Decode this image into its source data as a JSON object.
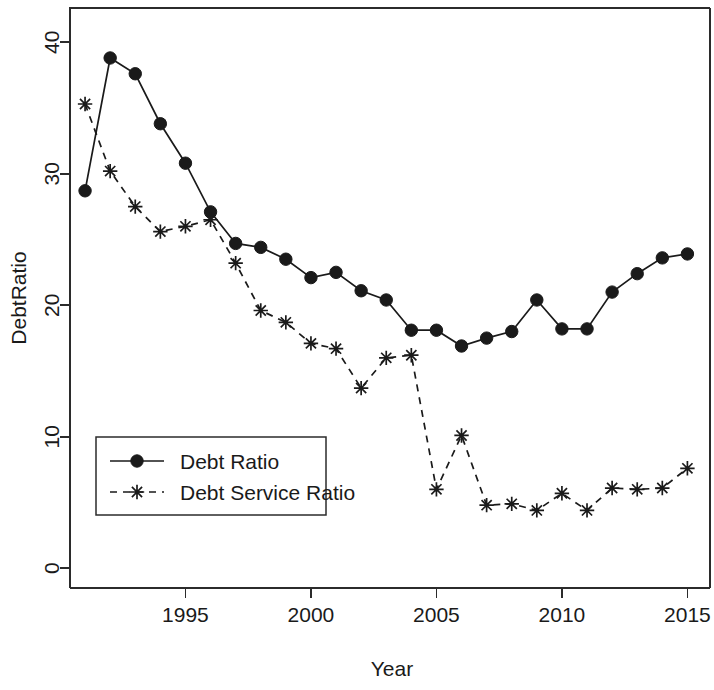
{
  "chart_data": {
    "type": "line",
    "title": "",
    "xlabel": "Year",
    "ylabel": "DebtRatio",
    "xlim": [
      1990.4,
      2015.9
    ],
    "ylim": [
      -1.5,
      42.6
    ],
    "grid": false,
    "legend_position": "center-left",
    "x": [
      1991,
      1992,
      1993,
      1994,
      1995,
      1996,
      1997,
      1998,
      1999,
      2000,
      2001,
      2002,
      2003,
      2004,
      2005,
      2006,
      2007,
      2008,
      2009,
      2010,
      2011,
      2012,
      2013,
      2014,
      2015
    ],
    "xticks": [
      1995,
      2000,
      2005,
      2010,
      2015
    ],
    "xticklabels": [
      "1995",
      "2000",
      "2005",
      "2010",
      "2015"
    ],
    "yticks": [
      0,
      10,
      20,
      30,
      40
    ],
    "yticklabels": [
      "0",
      "10",
      "20",
      "30",
      "40"
    ],
    "series": [
      {
        "name": "Debt Ratio",
        "marker": "filled-circle",
        "linestyle": "solid",
        "color": "#1a1a1a",
        "values": [
          28.7,
          38.8,
          37.6,
          33.8,
          30.8,
          27.1,
          24.7,
          24.4,
          23.5,
          22.1,
          22.5,
          21.1,
          20.4,
          18.1,
          18.1,
          16.9,
          17.5,
          18.0,
          20.4,
          18.2,
          18.2,
          21.0,
          22.4,
          23.6,
          23.9
        ]
      },
      {
        "name": "Debt Service Ratio",
        "marker": "asterisk",
        "linestyle": "dashed",
        "color": "#1a1a1a",
        "values": [
          35.3,
          30.2,
          27.5,
          25.6,
          26.0,
          26.5,
          23.2,
          19.6,
          18.7,
          17.1,
          16.7,
          13.7,
          16.0,
          16.2,
          6.0,
          10.1,
          4.8,
          4.9,
          4.4,
          5.7,
          4.4,
          6.1,
          6.0,
          6.1,
          7.6
        ]
      }
    ]
  },
  "legend": {
    "entries": [
      {
        "label": "Debt Ratio"
      },
      {
        "label": "Debt Service Ratio"
      }
    ]
  },
  "axes": {
    "x_title": "Year",
    "y_title": "DebtRatio"
  }
}
